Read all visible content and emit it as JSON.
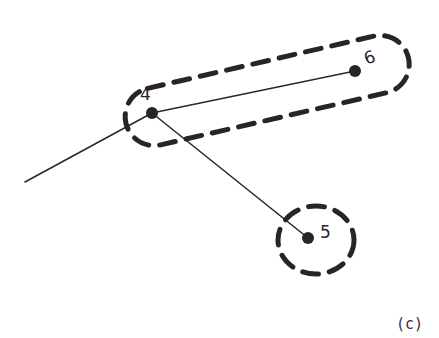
{
  "diagram": {
    "caption": "(c)",
    "nodes": [
      {
        "id": "4",
        "label": "4",
        "x": 152,
        "y": 113
      },
      {
        "id": "6",
        "label": "6",
        "x": 355,
        "y": 71
      },
      {
        "id": "5",
        "label": "5",
        "x": 308,
        "y": 238
      }
    ],
    "edges": [
      {
        "from": "4",
        "to": "6"
      },
      {
        "from": "4",
        "to": "5"
      },
      {
        "from": "4",
        "to": "external",
        "end": [
          25,
          182
        ]
      }
    ],
    "groups": [
      {
        "name": "group-4-6",
        "members": [
          "4",
          "6"
        ],
        "style": "dashed-ellipse"
      },
      {
        "name": "group-5",
        "members": [
          "5"
        ],
        "style": "dashed-circle"
      }
    ],
    "colors": {
      "ink": "#2b2424",
      "background": "#ffffff"
    }
  }
}
